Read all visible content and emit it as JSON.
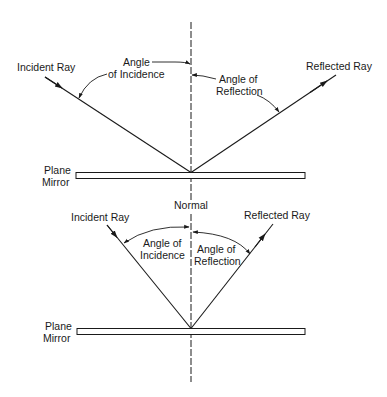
{
  "diagram": {
    "colors": {
      "ink": "#1a1a1a",
      "background": "#ffffff"
    },
    "top_figure": {
      "incident_ray_label": "Incident Ray",
      "reflected_ray_label": "Reflected Ray",
      "angle_incidence_line1": "Angle",
      "angle_incidence_line2": "of Incidence",
      "angle_reflection_line1": "Angle of",
      "angle_reflection_line2": "Reflection",
      "mirror_line1": "Plane",
      "mirror_line2": "Mirror"
    },
    "bottom_figure": {
      "normal_label": "Normal",
      "incident_ray_label": "Incident Ray",
      "reflected_ray_label": "Reflected Ray",
      "angle_incidence_line1": "Angle of",
      "angle_incidence_line2": "Incidence",
      "angle_reflection_line1": "Angle of",
      "angle_reflection_line2": "Reflection",
      "mirror_line1": "Plane",
      "mirror_line2": "Mirror"
    }
  }
}
